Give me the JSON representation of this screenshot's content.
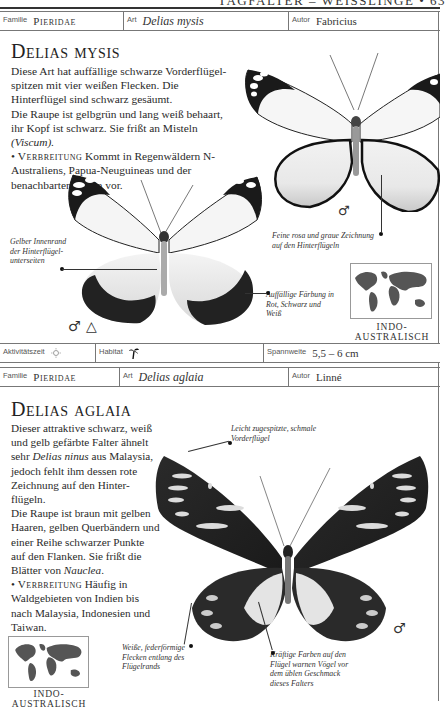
{
  "running_head": "TAGFALTER – WEISSLINGE • 63",
  "entries": [
    {
      "header": {
        "family_label": "Familie",
        "family": "Pieridae",
        "species_label": "Art",
        "species": "Delias mysis",
        "author_label": "Autor",
        "author": "Fabricius"
      },
      "title": "Delias mysis",
      "body": {
        "p1": "Diese Art hat auffällige schwarze Vorderflügel-spitzen mit vier weißen Flecken. Die Hinterflügel sind schwarz gesäumt.",
        "p2a": "Die Raupe ist gelbgrün und lang weiß behaart, ihr Kopf ist schwarz. Sie frißt an Misteln ",
        "p2b": "(Viscum).",
        "bullet": "•",
        "dist_label": "Verbreitung",
        "dist_text": " Kommt in Regenwäldern N-Australiens, Papua-Neuguineas und der benachbarten Inseln vor."
      },
      "callouts": [
        "Gelber Innenrand der Hinterflügel-unterseiten",
        "Feine rosa und graue Zeichnung auf den Hinterflügeln",
        "Auffällige Färbung in Rot, Schwarz und Weiß"
      ],
      "symbols": {
        "upper_butterfly": "♂",
        "lower_butterfly": "♂",
        "triangle": "△"
      },
      "map_caption": "INDO-AUSTRALISCH",
      "footer": {
        "activity_label": "Aktivitätszeit",
        "activity_icon": "sun-icon",
        "habitat_label": "Habitat",
        "habitat_icon": "palm-tree-icon",
        "wingspan_label": "Spannweite",
        "wingspan": "5,5 – 6 cm"
      }
    },
    {
      "header": {
        "family_label": "Familie",
        "family": "Pieridae",
        "species_label": "Art",
        "species": "Delias aglaia",
        "author_label": "Autor",
        "author": "Linné"
      },
      "title": "Delias aglaia",
      "body": {
        "p1a": "Dieser attraktive schwarz, weiß und gelb gefärbte Falter ähnelt sehr ",
        "p1b": "Delias ninus",
        "p1c": " aus Malaysia, jedoch fehlt ihm dessen rote Zeichnung auf den Hinter-flügeln.",
        "p2a": "Die Raupe ist braun mit gelben Haaren, gelben Querbändern und einer Reihe schwarzer Punkte auf den Flanken. Sie frißt die Blätter von ",
        "p2b": "Nauclea",
        "p2c": ".",
        "bullet": "•",
        "dist_label": "Verbreitung",
        "dist_text": " Häufig in Waldgebieten von Indien bis nach Malaysia, Indonesien und Taiwan."
      },
      "callouts": [
        "Leicht zugespitzte, schmale Vorderflügel",
        "Weiße, federförmige Flecken entlang des Flügelrands",
        "Kräftige Farben auf den Flügel warnen Vögel vor dem üblen Geschmack dieses Falters"
      ],
      "symbols": {
        "butterfly": "♂"
      },
      "map_caption": "INDO-AUSTRALISCH"
    }
  ]
}
